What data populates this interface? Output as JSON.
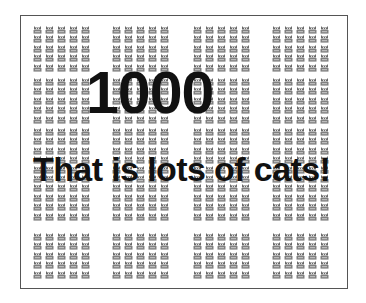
{
  "poster": {
    "headline": "1000",
    "subline": "That is lots of cats!",
    "icon": "cat-icon",
    "colors": {
      "frame": "#555555",
      "text": "#111111",
      "cat": "#6a6a6a",
      "background": "#ffffff"
    },
    "grid": {
      "column_block_x": [
        33,
        112,
        193,
        272
      ],
      "columns_per_block": 5,
      "column_spacing": 12,
      "row_blocks": [
        {
          "y": 26,
          "rows": 5
        },
        {
          "y": 78,
          "rows": 5
        },
        {
          "y": 128,
          "rows": 10
        },
        {
          "y": 233,
          "rows": 5
        }
      ],
      "row_spacing": 9.4
    }
  }
}
